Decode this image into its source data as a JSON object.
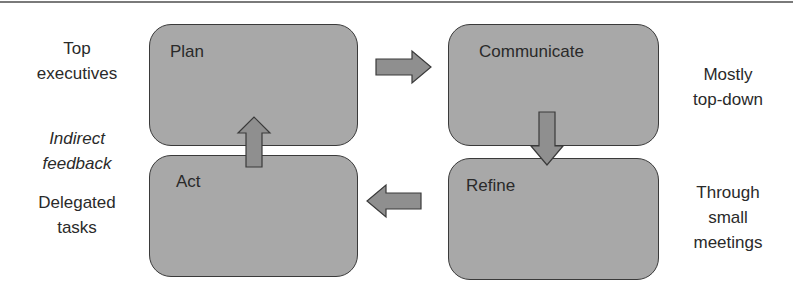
{
  "diagram": {
    "boxes": [
      {
        "id": "plan",
        "label": "Plan"
      },
      {
        "id": "communicate",
        "label": "Communicate"
      },
      {
        "id": "act",
        "label": "Act"
      },
      {
        "id": "refine",
        "label": "Refine"
      }
    ],
    "side_labels": {
      "top_executives": [
        "Top",
        "executives"
      ],
      "indirect_feedback": [
        "Indirect",
        "feedback"
      ],
      "delegated_tasks": [
        "Delegated",
        "tasks"
      ],
      "mostly_top_down": [
        "Mostly",
        "top-down"
      ],
      "through_small_meetings": [
        "Through",
        "small",
        "meetings"
      ]
    },
    "arrows": [
      {
        "from": "plan",
        "to": "communicate",
        "direction": "right"
      },
      {
        "from": "communicate",
        "to": "refine",
        "direction": "down"
      },
      {
        "from": "refine",
        "to": "act",
        "direction": "left"
      },
      {
        "from": "act",
        "to": "plan",
        "direction": "up"
      }
    ],
    "colors": {
      "box_fill": "#a8a8a8",
      "box_border": "#3a3a3a",
      "arrow_fill": "#8f8f8f",
      "text": "#2a2a2a"
    }
  }
}
